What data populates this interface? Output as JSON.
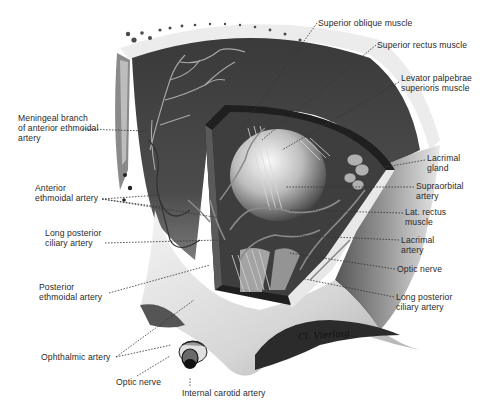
{
  "figure": {
    "colors": {
      "background": "#ffffff",
      "ink": "#2a2a2a",
      "dark_tissue": "#2e2e2e",
      "bone": "#d9d9d9"
    },
    "signature": "Cl. Vierling"
  },
  "labels": {
    "left": [
      {
        "id": "meningeal-branch",
        "text": "Meningeal branch\nof anterior ethmoidal\nartery",
        "x": 18,
        "y": 113
      },
      {
        "id": "anterior-ethmoidal-artery",
        "text": "Anterior\nethmoidal artery",
        "x": 35,
        "y": 183
      },
      {
        "id": "long-posterior-ciliary-artery-left",
        "text": "Long posterior\nciliary artery",
        "x": 45,
        "y": 228
      },
      {
        "id": "posterior-ethmoidal-artery",
        "text": "Posterior\nethmoidal artery",
        "x": 39,
        "y": 282
      },
      {
        "id": "ophthalmic-artery",
        "text": "Ophthalmic artery",
        "x": 41,
        "y": 354
      },
      {
        "id": "optic-nerve-bottom",
        "text": "Optic nerve",
        "x": 116,
        "y": 379
      },
      {
        "id": "internal-carotid-artery",
        "text": "Internal carotid artery",
        "x": 182,
        "y": 388
      }
    ],
    "right": [
      {
        "id": "superior-oblique-muscle",
        "text": "Superior oblique muscle",
        "x": 318,
        "y": 18
      },
      {
        "id": "superior-rectus-muscle",
        "text": "Superior rectus muscle",
        "x": 377,
        "y": 40
      },
      {
        "id": "levator-palpebrae",
        "text": "Levator palpebrae\nsuperioris muscle",
        "x": 401,
        "y": 73
      },
      {
        "id": "lacrimal-gland",
        "text": "Lacrimal\ngland",
        "x": 427,
        "y": 153
      },
      {
        "id": "supraorbital-artery",
        "text": "Supraorbital\nartery",
        "x": 416,
        "y": 181
      },
      {
        "id": "lat-rectus-muscle",
        "text": "Lat. rectus\nmuscle",
        "x": 405,
        "y": 207
      },
      {
        "id": "lacrimal-artery",
        "text": "Lacrimal\nartery",
        "x": 401,
        "y": 235
      },
      {
        "id": "optic-nerve-right",
        "text": "Optic nerve",
        "x": 397,
        "y": 264
      },
      {
        "id": "long-posterior-ciliary-artery-right",
        "text": "Long posterior\nciliary artery",
        "x": 396,
        "y": 292
      }
    ]
  },
  "leaders": [
    {
      "for": "meningeal-branch",
      "points": [
        [
          82,
          129
        ],
        [
          147,
          131
        ]
      ]
    },
    {
      "for": "anterior-ethmoidal-artery",
      "points": [
        [
          102,
          199
        ],
        [
          160,
          195
        ]
      ]
    },
    {
      "for": "anterior-ethmoidal-artery",
      "points": [
        [
          102,
          199
        ],
        [
          160,
          207
        ]
      ]
    },
    {
      "for": "anterior-ethmoidal-artery",
      "points": [
        [
          102,
          199
        ],
        [
          220,
          218
        ]
      ]
    },
    {
      "for": "long-posterior-ciliary-artery-left",
      "points": [
        [
          105,
          243
        ],
        [
          220,
          240
        ]
      ]
    },
    {
      "for": "posterior-ethmoidal-artery",
      "points": [
        [
          109,
          293
        ],
        [
          210,
          265
        ]
      ]
    },
    {
      "for": "ophthalmic-artery",
      "points": [
        [
          116,
          357
        ],
        [
          194,
          300
        ]
      ]
    },
    {
      "for": "ophthalmic-artery",
      "points": [
        [
          116,
          357
        ],
        [
          171,
          345
        ]
      ]
    },
    {
      "for": "optic-nerve-bottom",
      "points": [
        [
          137,
          376
        ],
        [
          170,
          356
        ]
      ]
    },
    {
      "for": "internal-carotid-artery",
      "points": [
        [
          190,
          386
        ],
        [
          190,
          378
        ]
      ]
    },
    {
      "for": "superior-oblique-muscle",
      "points": [
        [
          317,
          23
        ],
        [
          240,
          130
        ]
      ]
    },
    {
      "for": "superior-rectus-muscle",
      "points": [
        [
          376,
          45
        ],
        [
          262,
          140
        ]
      ]
    },
    {
      "for": "levator-palpebrae",
      "points": [
        [
          399,
          82
        ],
        [
          282,
          150
        ]
      ]
    },
    {
      "for": "lacrimal-gland",
      "points": [
        [
          425,
          160
        ],
        [
          380,
          168
        ]
      ]
    },
    {
      "for": "supraorbital-artery",
      "points": [
        [
          414,
          187
        ],
        [
          285,
          187
        ]
      ]
    },
    {
      "for": "lat-rectus-muscle",
      "points": [
        [
          403,
          213
        ],
        [
          290,
          210
        ]
      ]
    },
    {
      "for": "lacrimal-artery",
      "points": [
        [
          399,
          240
        ],
        [
          290,
          235
        ]
      ]
    },
    {
      "for": "optic-nerve-right",
      "points": [
        [
          395,
          269
        ],
        [
          290,
          253
        ]
      ]
    },
    {
      "for": "long-posterior-ciliary-artery-right",
      "points": [
        [
          394,
          297
        ],
        [
          300,
          278
        ]
      ]
    }
  ]
}
